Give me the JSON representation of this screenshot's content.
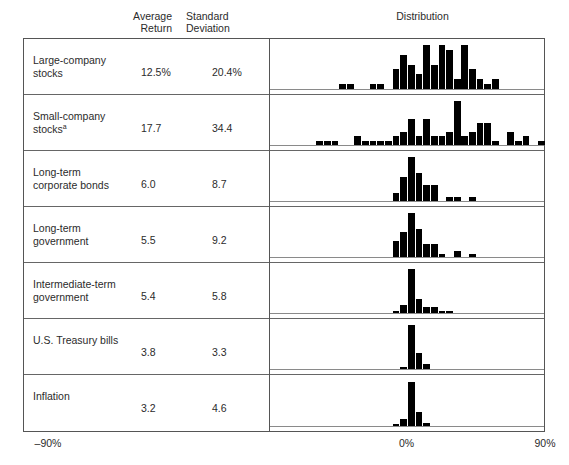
{
  "header": {
    "average_return": "Average\nReturn",
    "standard_deviation": "Standard\nDeviation",
    "distribution": "Distribution"
  },
  "axis": {
    "left_label": "–90%",
    "center_label": "0%",
    "right_label": "90%",
    "min": -90,
    "max": 90,
    "zero": 0
  },
  "rows": [
    {
      "label": "Large-company\nstocks",
      "average_return": "12.5%",
      "standard_deviation": "20.4%",
      "footnote": ""
    },
    {
      "label": "Small-company\nstocks",
      "average_return": "17.7",
      "standard_deviation": "34.4",
      "footnote": "a"
    },
    {
      "label": "Long-term\ncorporate bonds",
      "average_return": "6.0",
      "standard_deviation": "8.7",
      "footnote": ""
    },
    {
      "label": "Long-term\ngovernment",
      "average_return": "5.5",
      "standard_deviation": "9.2",
      "footnote": ""
    },
    {
      "label": "Intermediate-term\ngovernment",
      "average_return": "5.4",
      "standard_deviation": "5.8",
      "footnote": ""
    },
    {
      "label": "U.S. Treasury bills",
      "average_return": "3.8",
      "standard_deviation": "3.3",
      "footnote": ""
    },
    {
      "label": "Inflation",
      "average_return": "3.2",
      "standard_deviation": "4.6",
      "footnote": ""
    }
  ],
  "colors": {
    "bar": "#000000",
    "frame": "#555555",
    "baseline": "#8a8a8a",
    "text": "#2b2b2b",
    "background": "#ffffff"
  },
  "chart_data": {
    "type": "bar",
    "title": "Distribution",
    "xlabel": "Annual return (%)",
    "ylabel": "Frequency (years)",
    "xlim": [
      -90,
      90
    ],
    "grid": false,
    "legend": "none",
    "bin_width": 5,
    "note": "Seven stacked histograms of annual returns; x is percent return, y is count of years per 5% bin.",
    "series": [
      {
        "name": "Large-company stocks",
        "average_return": 12.5,
        "standard_deviation": 20.4,
        "bins": [
          -50,
          -45,
          -40,
          -35,
          -30,
          -25,
          -20,
          -15,
          -10,
          -5,
          0,
          5,
          10,
          15,
          20,
          25,
          30,
          35,
          40,
          45,
          50,
          55
        ],
        "counts": [
          0,
          1,
          1,
          0,
          0,
          1,
          1,
          0,
          4,
          7,
          5,
          3,
          9,
          5,
          9,
          8,
          2,
          9,
          4,
          2,
          1,
          2
        ]
      },
      {
        "name": "Small-company stocks",
        "average_return": 17.7,
        "standard_deviation": 34.4,
        "bins": [
          -60,
          -55,
          -50,
          -45,
          -40,
          -35,
          -30,
          -25,
          -20,
          -15,
          -10,
          -5,
          0,
          5,
          10,
          15,
          20,
          25,
          30,
          35,
          40,
          45,
          50,
          55,
          60,
          65,
          70,
          75,
          80,
          85
        ],
        "counts": [
          1,
          1,
          1,
          0,
          0,
          2,
          1,
          1,
          1,
          1,
          2,
          3,
          6,
          2,
          6,
          2,
          2,
          3,
          10,
          2,
          3,
          5,
          5,
          1,
          0,
          3,
          1,
          2,
          0,
          1
        ]
      },
      {
        "name": "Long-term corporate bonds",
        "average_return": 6.0,
        "standard_deviation": 8.7,
        "bins": [
          -10,
          -5,
          0,
          5,
          10,
          15,
          20,
          25,
          30,
          35,
          40
        ],
        "counts": [
          2,
          6,
          11,
          7,
          4,
          4,
          0,
          1,
          1,
          0,
          1
        ]
      },
      {
        "name": "Long-term government",
        "average_return": 5.5,
        "standard_deviation": 9.2,
        "bins": [
          -10,
          -5,
          0,
          5,
          10,
          15,
          20,
          25,
          30,
          35,
          40,
          45
        ],
        "counts": [
          5,
          8,
          14,
          9,
          4,
          4,
          1,
          0,
          2,
          0,
          1,
          0
        ]
      },
      {
        "name": "Intermediate-term government",
        "average_return": 5.4,
        "standard_deviation": 5.8,
        "bins": [
          -10,
          -5,
          0,
          5,
          10,
          15,
          20,
          25,
          30
        ],
        "counts": [
          1,
          4,
          22,
          7,
          3,
          3,
          1,
          1,
          0
        ]
      },
      {
        "name": "U.S. Treasury bills",
        "average_return": 3.8,
        "standard_deviation": 3.3,
        "bins": [
          -5,
          0,
          5,
          10,
          15
        ],
        "counts": [
          1,
          24,
          9,
          3,
          0
        ]
      },
      {
        "name": "Inflation",
        "average_return": 3.2,
        "standard_deviation": 4.6,
        "bins": [
          -10,
          -5,
          0,
          5,
          10,
          15
        ],
        "counts": [
          1,
          4,
          26,
          8,
          2,
          0
        ]
      }
    ]
  }
}
